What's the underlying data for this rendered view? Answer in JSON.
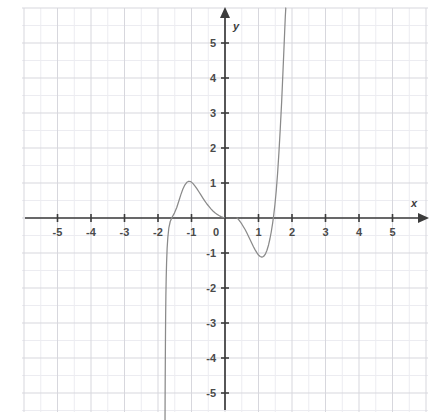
{
  "chart_data": {
    "type": "line",
    "title": "",
    "subtitle": "",
    "xlabel": "x",
    "ylabel": "y",
    "xlim": [
      -6.05,
      6.2
    ],
    "ylim": [
      -5.8,
      6.0
    ],
    "grid": true,
    "grid_major_step": 1,
    "grid_minor_step": 0.5,
    "legend": "none",
    "axis_arrows": [
      "x-positive",
      "y-positive"
    ],
    "xticks": [
      -5,
      -4,
      -3,
      -2,
      -1,
      0,
      1,
      2,
      3,
      4,
      5
    ],
    "xtick_labels": [
      "-5",
      "-4",
      "-3",
      "-2",
      "-1",
      "0",
      "1",
      "2",
      "3",
      "4",
      "5"
    ],
    "yticks": [
      -5,
      -4,
      -3,
      -2,
      -1,
      1,
      2,
      3,
      4,
      5
    ],
    "ytick_labels": [
      "-5",
      "-4",
      "-3",
      "-2",
      "-1",
      "1",
      "2",
      "3",
      "4",
      "5"
    ],
    "origin_label": "0",
    "series": [
      {
        "name": "left-branch",
        "note": "descends off bottom of plot near x=-1.78, crosses zero at x=-1.45, peaks at y=1.05 near x=-1.05, decays toward y=0 approaching x=0 from the left",
        "points": [
          [
            -1.79,
            -5.8
          ],
          [
            -1.788,
            -5.2
          ],
          [
            -1.785,
            -4.6
          ],
          [
            -1.781,
            -4.0
          ],
          [
            -1.777,
            -3.4
          ],
          [
            -1.772,
            -2.8
          ],
          [
            -1.765,
            -2.25
          ],
          [
            -1.756,
            -1.75
          ],
          [
            -1.744,
            -1.28
          ],
          [
            -1.728,
            -0.88
          ],
          [
            -1.706,
            -0.55
          ],
          [
            -1.676,
            -0.28
          ],
          [
            -1.635,
            -0.1
          ],
          [
            -1.58,
            0.02
          ],
          [
            -1.51,
            0.14
          ],
          [
            -1.44,
            0.3
          ],
          [
            -1.38,
            0.48
          ],
          [
            -1.32,
            0.66
          ],
          [
            -1.26,
            0.82
          ],
          [
            -1.2,
            0.94
          ],
          [
            -1.14,
            1.02
          ],
          [
            -1.08,
            1.05
          ],
          [
            -1.02,
            1.04
          ],
          [
            -0.96,
            0.99
          ],
          [
            -0.9,
            0.92
          ],
          [
            -0.84,
            0.84
          ],
          [
            -0.78,
            0.75
          ],
          [
            -0.72,
            0.66
          ],
          [
            -0.66,
            0.57
          ],
          [
            -0.6,
            0.48
          ],
          [
            -0.54,
            0.4
          ],
          [
            -0.48,
            0.33
          ],
          [
            -0.42,
            0.26
          ],
          [
            -0.36,
            0.2
          ],
          [
            -0.3,
            0.15
          ],
          [
            -0.24,
            0.11
          ],
          [
            -0.18,
            0.07
          ],
          [
            -0.12,
            0.04
          ],
          [
            -0.06,
            0.02
          ],
          [
            -0.02,
            0.01
          ]
        ]
      },
      {
        "name": "right-branch",
        "note": "emerges near x=0.36 at y=0, dips to minimum y=-1.12 near x=1.10, crosses zero at x=1.45, rises steeply off the top of the plot near x=1.82",
        "points": [
          [
            0.36,
            0.0
          ],
          [
            0.4,
            -0.04
          ],
          [
            0.45,
            -0.1
          ],
          [
            0.5,
            -0.17
          ],
          [
            0.55,
            -0.25
          ],
          [
            0.6,
            -0.33
          ],
          [
            0.65,
            -0.42
          ],
          [
            0.7,
            -0.52
          ],
          [
            0.75,
            -0.62
          ],
          [
            0.8,
            -0.72
          ],
          [
            0.85,
            -0.82
          ],
          [
            0.9,
            -0.91
          ],
          [
            0.95,
            -0.99
          ],
          [
            1.0,
            -1.06
          ],
          [
            1.05,
            -1.1
          ],
          [
            1.1,
            -1.12
          ],
          [
            1.15,
            -1.1
          ],
          [
            1.2,
            -1.04
          ],
          [
            1.25,
            -0.93
          ],
          [
            1.3,
            -0.77
          ],
          [
            1.34,
            -0.6
          ],
          [
            1.38,
            -0.4
          ],
          [
            1.42,
            -0.16
          ],
          [
            1.45,
            0.05
          ],
          [
            1.49,
            0.38
          ],
          [
            1.53,
            0.78
          ],
          [
            1.57,
            1.28
          ],
          [
            1.61,
            1.88
          ],
          [
            1.65,
            2.55
          ],
          [
            1.69,
            3.3
          ],
          [
            1.72,
            3.95
          ],
          [
            1.75,
            4.62
          ],
          [
            1.78,
            5.3
          ],
          [
            1.8,
            5.75
          ],
          [
            1.815,
            6.0
          ]
        ]
      }
    ]
  },
  "style": {
    "curve_color": "#8a8a8a",
    "axis_color": "#3c3c3c",
    "grid_major_color": "#d7d7dd",
    "grid_minor_color": "#ececf1",
    "background": "#ffffff",
    "label_color": "#4a4a4a"
  }
}
